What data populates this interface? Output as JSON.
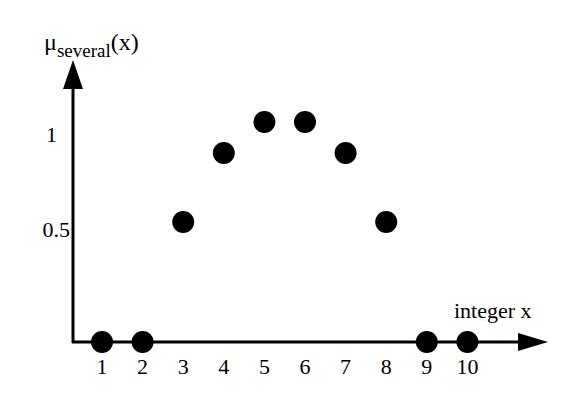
{
  "chart_data": {
    "type": "scatter",
    "title": "",
    "xlabel": "integer x",
    "ylabel": "μ_several(x)",
    "ylabel_main": "μ",
    "ylabel_sub": "several",
    "ylabel_arg": "(x)",
    "x": [
      1,
      2,
      3,
      4,
      5,
      6,
      7,
      8,
      9,
      10
    ],
    "values": [
      0,
      0,
      0.5,
      0.8,
      1,
      1,
      0.8,
      0.5,
      0,
      0
    ],
    "x_ticks": [
      "1",
      "2",
      "3",
      "4",
      "5",
      "6",
      "7",
      "8",
      "9",
      "10"
    ],
    "y_ticks": [
      "0.5",
      "1"
    ],
    "xlim": [
      0,
      11
    ],
    "ylim": [
      0,
      1.1
    ],
    "grid": false,
    "legend": null,
    "marker": "filled-circle",
    "marker_color": "#000000"
  },
  "labels": {
    "y_axis_main": "μ",
    "y_axis_sub": "several",
    "y_axis_arg": "(x)",
    "x_axis": "integer x",
    "y_tick_1": "1",
    "y_tick_05": "0.5",
    "x_ticks": [
      "1",
      "2",
      "3",
      "4",
      "5",
      "6",
      "7",
      "8",
      "9",
      "10"
    ]
  }
}
